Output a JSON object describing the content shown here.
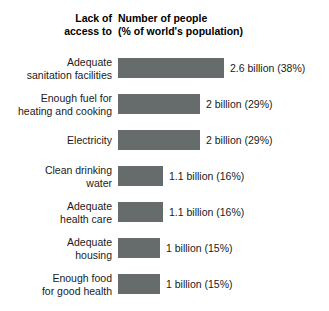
{
  "header": {
    "left_line1": "Lack of",
    "left_line2": "access to",
    "right_line1": "Number of people",
    "right_line2": "(% of world's population)"
  },
  "chart_data": {
    "type": "bar",
    "orientation": "horizontal",
    "title": "",
    "xlabel": "Number of people (% of world's population)",
    "ylabel": "Lack of access to",
    "grid": false,
    "legend": "none",
    "xlim": [
      0,
      2.6
    ],
    "bar_color": "#666b6b",
    "categories": [
      "Adequate sanitation facilities",
      "Enough fuel for heating and cooking",
      "Electricity",
      "Clean drinking water",
      "Adequate health care",
      "Adequate housing",
      "Enough food for good health"
    ],
    "values": [
      2.6,
      2,
      2,
      1.1,
      1.1,
      1,
      1
    ],
    "percentages": [
      38,
      29,
      29,
      16,
      16,
      15,
      15
    ],
    "value_labels": [
      "2.6 billion (38%)",
      "2 billion (29%)",
      "2 billion (29%)",
      "1.1 billion (16%)",
      "1.1 billion (16%)",
      "1 billion (15%)",
      "1 billion (15%)"
    ]
  },
  "rows": [
    {
      "label_line1": "Adequate",
      "label_line2": "sanitation facilities",
      "value_label": "2.6 billion (38%)",
      "bar_px": 106
    },
    {
      "label_line1": "Enough fuel for",
      "label_line2": "heating and cooking",
      "value_label": "2 billion (29%)",
      "bar_px": 82
    },
    {
      "label_line1": "Electricity",
      "label_line2": "",
      "value_label": "2 billion (29%)",
      "bar_px": 82
    },
    {
      "label_line1": "Clean drinking",
      "label_line2": "water",
      "value_label": "1.1 billion (16%)",
      "bar_px": 45
    },
    {
      "label_line1": "Adequate",
      "label_line2": "health care",
      "value_label": "1.1 billion (16%)",
      "bar_px": 45
    },
    {
      "label_line1": "Adequate",
      "label_line2": "housing",
      "value_label": "1 billion (15%)",
      "bar_px": 42
    },
    {
      "label_line1": "Enough food",
      "label_line2": "for good health",
      "value_label": "1 billion (15%)",
      "bar_px": 42
    }
  ]
}
